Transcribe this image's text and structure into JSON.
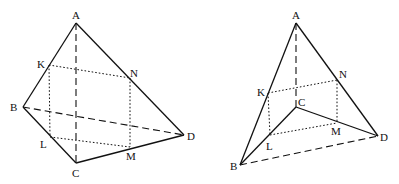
{
  "figures": [
    {
      "name": "left-tetrahedron",
      "points": {
        "A": [
          76,
          23
        ],
        "B": [
          23,
          107
        ],
        "C": [
          76,
          163
        ],
        "D": [
          184,
          135
        ],
        "K": [
          49,
          65
        ],
        "L": [
          50,
          137
        ],
        "M": [
          130,
          147
        ],
        "N": [
          130,
          78
        ]
      },
      "labels": [
        {
          "text": "A",
          "x": 72,
          "y": 19
        },
        {
          "text": "K",
          "x": 37,
          "y": 68
        },
        {
          "text": "N",
          "x": 130,
          "y": 78
        },
        {
          "text": "B",
          "x": 10,
          "y": 111
        },
        {
          "text": "L",
          "x": 40,
          "y": 146
        },
        {
          "text": "C",
          "x": 72,
          "y": 176
        },
        {
          "text": "M",
          "x": 126,
          "y": 160
        },
        {
          "text": "D",
          "x": 187,
          "y": 140
        }
      ]
    },
    {
      "name": "right-tetrahedron",
      "points": {
        "A": [
          296,
          23
        ],
        "B": [
          240,
          165
        ],
        "C": [
          296,
          107
        ],
        "D": [
          378,
          136
        ],
        "K": [
          268,
          93
        ],
        "L": [
          270,
          135
        ],
        "M": [
          337,
          123
        ],
        "N": [
          337,
          80
        ]
      },
      "labels": [
        {
          "text": "A",
          "x": 292,
          "y": 19
        },
        {
          "text": "K",
          "x": 257,
          "y": 96
        },
        {
          "text": "N",
          "x": 339,
          "y": 78
        },
        {
          "text": "C",
          "x": 298,
          "y": 106
        },
        {
          "text": "L",
          "x": 266,
          "y": 150
        },
        {
          "text": "M",
          "x": 331,
          "y": 135
        },
        {
          "text": "B",
          "x": 230,
          "y": 170
        },
        {
          "text": "D",
          "x": 380,
          "y": 141
        }
      ]
    }
  ]
}
